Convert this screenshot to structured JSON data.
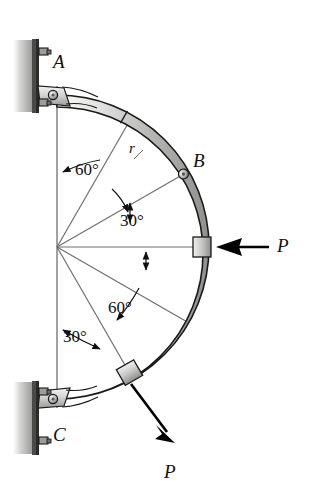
{
  "figure": {
    "type": "engineering-mechanics-free-body-diagram",
    "background": "#ffffff",
    "ink_color": "#111111",
    "bar_fill_light": "#e8e8e6",
    "bar_fill_mid": "#bdbdbb",
    "bar_fill_dark": "#8a8a88",
    "wall_color": "#b9b9b7",
    "line_color": "#6f6f6f"
  },
  "geometry": {
    "center_x": 57,
    "center_y": 247,
    "radius_outer": 152,
    "radius_inner": 140,
    "vertical_line_top": 86,
    "vertical_line_bottom": 408,
    "horizontal_line_end_x": 205
  },
  "labels": {
    "point_a": "A",
    "point_b": "B",
    "point_c": "C",
    "radius": "r",
    "force_right": "P",
    "force_lower": "P"
  },
  "angles": {
    "upper_from_vertical": "60°",
    "upper_from_horizontal": "30°",
    "lower_from_horizontal": "60°",
    "lower_from_vertical": "30°"
  },
  "angle_values": {
    "upper_from_vertical_deg": 60,
    "upper_from_horizontal_deg": 30,
    "lower_from_horizontal_deg": 60,
    "lower_from_vertical_deg": 30
  },
  "supports": [
    {
      "name": "top-bracket",
      "label": "A",
      "type": "pinned-wall-bracket",
      "bolts": 2
    },
    {
      "name": "bottom-bracket",
      "label": "C",
      "type": "pinned-wall-bracket",
      "bolts": 2
    }
  ],
  "forces": [
    {
      "name": "force-p-right",
      "label": "P",
      "direction": "horizontal-left",
      "applied_at": "collar on arc at 0 degrees"
    },
    {
      "name": "force-p-lower",
      "label": "P",
      "direction": "down-right",
      "applied_at": "collar on arc at 60 degrees below horizontal"
    }
  ]
}
